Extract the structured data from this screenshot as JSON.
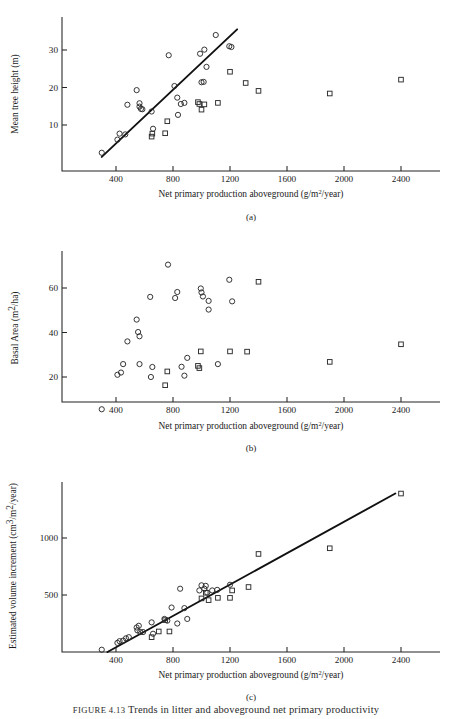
{
  "figure": {
    "caption_prefix": "FIGURE 4.13",
    "caption_rest": "Trends in litter and aboveground net primary productivity"
  },
  "axis": {
    "x_title_main": "Net primary production aboveground (g/m",
    "x_title_sup": "2",
    "x_title_tail": "/year)",
    "x_ticks": [
      "400",
      "800",
      "1200",
      "1600",
      "2000",
      "2400"
    ],
    "x_tick_values": [
      400,
      800,
      1200,
      1600,
      2000,
      2400
    ]
  },
  "panels": [
    {
      "letter": "(a)",
      "y_title_main": "Mean tree height (m)",
      "y_ticks": [
        "10",
        "20",
        "30"
      ],
      "y_tick_values": [
        10,
        20,
        30
      ]
    },
    {
      "letter": "(b)",
      "y_title_main": "Basal Area (m",
      "y_title_sup": "2",
      "y_title_tail": "/ha)",
      "y_ticks": [
        "20",
        "40",
        "60"
      ],
      "y_tick_values": [
        20,
        40,
        60
      ]
    },
    {
      "letter": "(c)",
      "y_title_main": "Estimated volume increment (cm",
      "y_title_sup": "3",
      "y_title_mid": "/m",
      "y_title_sup2": "2",
      "y_title_tail": "/year)",
      "y_ticks": [
        "500",
        "1000"
      ],
      "y_tick_values": [
        500,
        1000
      ]
    }
  ],
  "chart_data": [
    {
      "type": "scatter",
      "panel": "(a)",
      "title": "",
      "xlabel": "Net primary production aboveground (g/m2/year)",
      "ylabel": "Mean tree height (m)",
      "xlim": [
        0,
        2600
      ],
      "ylim": [
        0,
        36
      ],
      "grid": false,
      "legend": "none",
      "trendline": {
        "x": [
          300,
          1250
        ],
        "y": [
          1.5,
          35.5
        ]
      },
      "series": [
        {
          "name": "circles",
          "marker": "open-circle",
          "points": [
            [
              300,
              2.6
            ],
            [
              410,
              6.1
            ],
            [
              425,
              7.7
            ],
            [
              465,
              7.5
            ],
            [
              480,
              15.4
            ],
            [
              545,
              19.3
            ],
            [
              565,
              15.8
            ],
            [
              565,
              14.9
            ],
            [
              575,
              14.3
            ],
            [
              585,
              14.2
            ],
            [
              650,
              13.6
            ],
            [
              660,
              9.0
            ],
            [
              770,
              28.6
            ],
            [
              810,
              20.4
            ],
            [
              830,
              17.3
            ],
            [
              835,
              12.7
            ],
            [
              855,
              15.6
            ],
            [
              880,
              15.9
            ],
            [
              990,
              29.0
            ],
            [
              1000,
              21.4
            ],
            [
              1015,
              21.5
            ],
            [
              1020,
              30.1
            ],
            [
              1035,
              25.5
            ],
            [
              1100,
              34.0
            ],
            [
              1195,
              31.0
            ],
            [
              1210,
              30.8
            ]
          ]
        },
        {
          "name": "squares",
          "marker": "open-square",
          "points": [
            [
              650,
              6.9
            ],
            [
              655,
              7.7
            ],
            [
              745,
              7.8
            ],
            [
              760,
              11.0
            ],
            [
              975,
              16.1
            ],
            [
              985,
              15.6
            ],
            [
              1000,
              14.1
            ],
            [
              1020,
              15.5
            ],
            [
              1115,
              15.9
            ],
            [
              1200,
              24.2
            ],
            [
              1310,
              21.2
            ],
            [
              1400,
              19.1
            ],
            [
              1900,
              18.4
            ],
            [
              2400,
              22.1
            ]
          ]
        }
      ]
    },
    {
      "type": "scatter",
      "panel": "(b)",
      "xlabel": "Net primary production aboveground (g/m2/year)",
      "ylabel": "Basal Area (m2/ha)",
      "xlim": [
        0,
        2600
      ],
      "ylim": [
        0,
        72
      ],
      "grid": false,
      "legend": "none",
      "trendline": null,
      "series": [
        {
          "name": "circles",
          "marker": "open-circle",
          "points": [
            [
              300,
              5.5
            ],
            [
              410,
              21.0
            ],
            [
              435,
              22.0
            ],
            [
              450,
              25.8
            ],
            [
              480,
              36.0
            ],
            [
              545,
              45.8
            ],
            [
              555,
              40.2
            ],
            [
              565,
              38.3
            ],
            [
              565,
              25.8
            ],
            [
              640,
              56.0
            ],
            [
              645,
              20.0
            ],
            [
              655,
              24.5
            ],
            [
              765,
              70.5
            ],
            [
              815,
              55.5
            ],
            [
              830,
              58.2
            ],
            [
              860,
              24.6
            ],
            [
              880,
              20.6
            ],
            [
              900,
              28.6
            ],
            [
              995,
              59.8
            ],
            [
              1000,
              58.0
            ],
            [
              1010,
              56.2
            ],
            [
              1050,
              54.2
            ],
            [
              1050,
              50.3
            ],
            [
              1115,
              25.8
            ],
            [
              1195,
              63.7
            ],
            [
              1215,
              54.0
            ]
          ]
        },
        {
          "name": "squares",
          "marker": "open-square",
          "points": [
            [
              745,
              16.3
            ],
            [
              760,
              22.5
            ],
            [
              975,
              25.0
            ],
            [
              985,
              24.0
            ],
            [
              995,
              31.5
            ],
            [
              1200,
              31.5
            ],
            [
              1320,
              31.4
            ],
            [
              1400,
              62.8
            ],
            [
              1900,
              26.8
            ],
            [
              2400,
              34.7
            ]
          ]
        }
      ]
    },
    {
      "type": "scatter",
      "panel": "(c)",
      "xlabel": "Net primary production aboveground (g/m2/year)",
      "ylabel": "Estimated volume increment (cm3/m2/year)",
      "xlim": [
        0,
        2600
      ],
      "ylim": [
        0,
        1450
      ],
      "grid": false,
      "legend": "none",
      "trendline": {
        "x": [
          340,
          2360
        ],
        "y": [
          0,
          1390
        ]
      },
      "series": [
        {
          "name": "circles",
          "marker": "open-circle",
          "points": [
            [
              300,
              20
            ],
            [
              410,
              80
            ],
            [
              425,
              95
            ],
            [
              450,
              100
            ],
            [
              470,
              120
            ],
            [
              490,
              130
            ],
            [
              545,
              215
            ],
            [
              550,
              190
            ],
            [
              560,
              230
            ],
            [
              570,
              175
            ],
            [
              590,
              175
            ],
            [
              650,
              260
            ],
            [
              660,
              160
            ],
            [
              740,
              290
            ],
            [
              760,
              275
            ],
            [
              790,
              390
            ],
            [
              830,
              250
            ],
            [
              850,
              555
            ],
            [
              880,
              385
            ],
            [
              900,
              290
            ],
            [
              985,
              540
            ],
            [
              1000,
              585
            ],
            [
              1020,
              555
            ],
            [
              1030,
              580
            ],
            [
              1040,
              520
            ],
            [
              1075,
              540
            ],
            [
              1110,
              545
            ],
            [
              1200,
              590
            ]
          ]
        },
        {
          "name": "squares",
          "marker": "open-square",
          "points": [
            [
              650,
              130
            ],
            [
              700,
              180
            ],
            [
              745,
              280
            ],
            [
              775,
              180
            ],
            [
              1000,
              470
            ],
            [
              1030,
              520
            ],
            [
              1050,
              455
            ],
            [
              1115,
              475
            ],
            [
              1200,
              475
            ],
            [
              1215,
              540
            ],
            [
              1330,
              570
            ],
            [
              1400,
              860
            ],
            [
              1900,
              910
            ],
            [
              2400,
              1390
            ]
          ]
        }
      ]
    }
  ]
}
